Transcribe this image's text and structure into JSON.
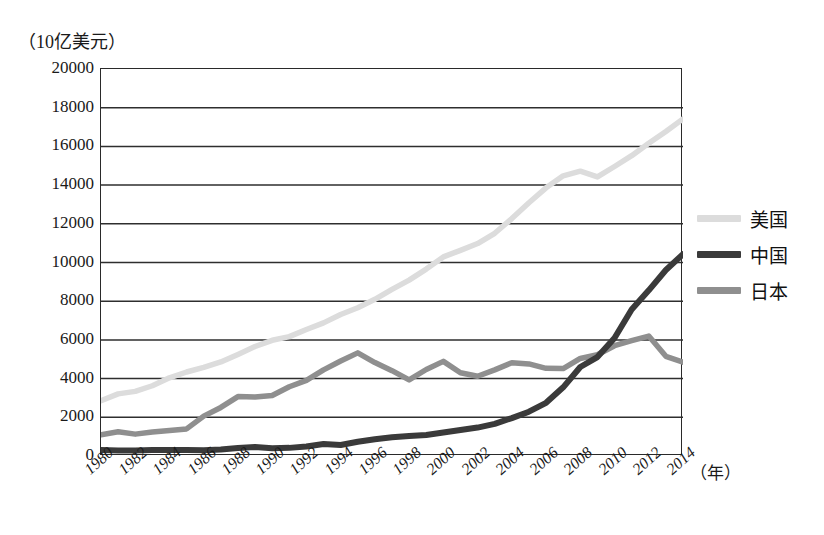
{
  "chart_data": {
    "type": "line",
    "title": "",
    "ylabel": "（10亿美元）",
    "xlabel": "（年）",
    "ylim": [
      0,
      20000
    ],
    "ytick_step": 2000,
    "yticks": [
      "20000",
      "18000",
      "16000",
      "14000",
      "12000",
      "10000",
      "8000",
      "6000",
      "4000",
      "2000",
      "0"
    ],
    "xlim": [
      1980,
      2014
    ],
    "xtick_step": 2,
    "xticks": [
      "1980",
      "1982",
      "1984",
      "1986",
      "1988",
      "1990",
      "1992",
      "1994",
      "1996",
      "1998",
      "2000",
      "2002",
      "2004",
      "2006",
      "2008",
      "2010",
      "2012",
      "2014"
    ],
    "grid": true,
    "grid_axis": "y",
    "legend_position": "right",
    "x": [
      1980,
      1981,
      1982,
      1983,
      1984,
      1985,
      1986,
      1987,
      1988,
      1989,
      1990,
      1991,
      1992,
      1993,
      1994,
      1995,
      1996,
      1997,
      1998,
      1999,
      2000,
      2001,
      2002,
      2003,
      2004,
      2005,
      2006,
      2007,
      2008,
      2009,
      2010,
      2011,
      2012,
      2013,
      2014
    ],
    "series": [
      {
        "name": "美国",
        "color": "#dcdcdc",
        "values": [
          2860,
          3210,
          3340,
          3630,
          4040,
          4340,
          4580,
          4860,
          5250,
          5660,
          5980,
          6170,
          6540,
          6880,
          7310,
          7660,
          8100,
          8610,
          9090,
          9660,
          10290,
          10630,
          10980,
          11510,
          12270,
          13090,
          13860,
          14480,
          14720,
          14420,
          14960,
          15520,
          16160,
          16770,
          17420
        ]
      },
      {
        "name": "中国",
        "color": "#3a3a3a",
        "values": [
          305,
          290,
          280,
          305,
          315,
          310,
          300,
          330,
          410,
          460,
          400,
          420,
          495,
          620,
          570,
          740,
          870,
          970,
          1030,
          1090,
          1210,
          1340,
          1470,
          1660,
          1960,
          2290,
          2750,
          3550,
          4600,
          5110,
          6100,
          7570,
          8560,
          9610,
          10430
        ]
      },
      {
        "name": "日本",
        "color": "#8f8f8f",
        "values": [
          1100,
          1250,
          1130,
          1240,
          1320,
          1400,
          2060,
          2510,
          3070,
          3050,
          3130,
          3580,
          3910,
          4450,
          4910,
          5330,
          4830,
          4410,
          3930,
          4470,
          4890,
          4300,
          4120,
          4450,
          4820,
          4760,
          4530,
          4520,
          5040,
          5230,
          5700,
          5960,
          6200,
          5150,
          4850
        ]
      }
    ]
  },
  "legend": {
    "items": [
      {
        "label": "美国",
        "color": "#dcdcdc"
      },
      {
        "label": "中国",
        "color": "#3a3a3a"
      },
      {
        "label": "日本",
        "color": "#8f8f8f"
      }
    ]
  }
}
